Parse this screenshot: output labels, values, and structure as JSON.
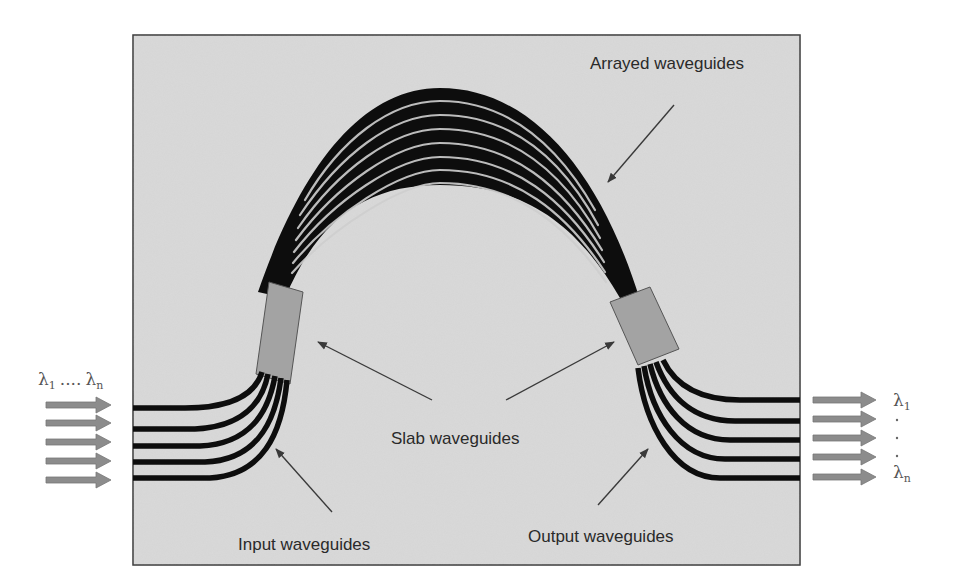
{
  "figure": {
    "colors": {
      "background": "#ffffff",
      "panel": "#d9d9d9",
      "panel_border": "#3a3a3a",
      "waveguide": "#0d0d0d",
      "slab": "#a3a3a3",
      "arrow_fill": "#8c8c8c",
      "text": "#2a2a2a"
    }
  },
  "labels": {
    "arrayed": "Arrayed waveguides",
    "slab": "Slab waveguides",
    "input": "Input waveguides",
    "output": "Output waveguides"
  },
  "input_side": {
    "lambda_symbol": "λ",
    "first_sub": "1",
    "ellipsis": "....",
    "last_sub": "n",
    "arrow_count": 5
  },
  "output_side": {
    "lambda_symbol": "λ",
    "first_sub": "1",
    "last_sub": "n",
    "arrow_count": 5
  },
  "components": {
    "arrayed_waveguide_count": 9,
    "input_waveguide_count": 5,
    "output_waveguide_count": 5,
    "slab_count": 2
  }
}
